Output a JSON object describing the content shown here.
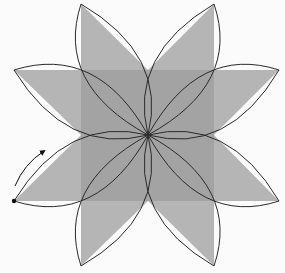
{
  "diagram": {
    "type": "eight-petal rosette construction",
    "colors": {
      "background": "#fbfbfb",
      "square_fill": "#a3a3a3",
      "triangle_fill": "#b2b2b2",
      "stroke": "#2a2a2a",
      "dot": "#111111"
    },
    "center": [
      148,
      135
    ],
    "square": {
      "x": 81,
      "y": 70,
      "width": 133,
      "height": 131
    },
    "petal_tips": [
      {
        "name": "top-left",
        "point": [
          81,
          4
        ]
      },
      {
        "name": "top-right",
        "point": [
          214,
          4
        ]
      },
      {
        "name": "right-top",
        "point": [
          279,
          70
        ]
      },
      {
        "name": "right-bottom",
        "point": [
          279,
          201
        ]
      },
      {
        "name": "bottom-right",
        "point": [
          214,
          266
        ]
      },
      {
        "name": "bottom-left",
        "point": [
          81,
          266
        ]
      },
      {
        "name": "left-bottom",
        "point": [
          14,
          201
        ]
      },
      {
        "name": "left-top",
        "point": [
          14,
          70
        ]
      }
    ],
    "triangles": [
      {
        "name": "top-left",
        "points": "81,4 81,70 148,70"
      },
      {
        "name": "top-right",
        "points": "214,4 148,70 214,70"
      },
      {
        "name": "right-top",
        "points": "279,70 214,70 214,135"
      },
      {
        "name": "right-bottom",
        "points": "279,201 214,135 214,201"
      },
      {
        "name": "bottom-right",
        "points": "214,266 214,201 148,201"
      },
      {
        "name": "bottom-left",
        "points": "81,266 148,201 81,201"
      },
      {
        "name": "left-bottom",
        "points": "14,201 81,201 81,135"
      },
      {
        "name": "left-top",
        "points": "14,70 81,135 81,70"
      }
    ],
    "marker": {
      "dot": [
        14,
        201
      ],
      "arrow_direction": "counterclockwise along petal edge (upward)"
    }
  }
}
